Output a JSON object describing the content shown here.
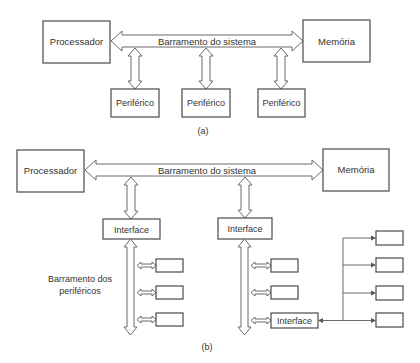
{
  "diagram_a": {
    "processor_label": "Processador",
    "memory_label": "Memória",
    "bus_label": "Barramento do sistema",
    "peripherals": [
      "Periférico",
      "Periférico",
      "Periférico"
    ],
    "caption": "(a)"
  },
  "diagram_b": {
    "processor_label": "Processador",
    "memory_label": "Memória",
    "bus_label": "Barramento do sistema",
    "interfaces": [
      "Interface",
      "Interface",
      "Interface"
    ],
    "peripheral_bus_label_line1": "Barramento dos",
    "peripheral_bus_label_line2": "periféricos",
    "caption": "(b)"
  },
  "colors": {
    "stroke": "#4a4a4a",
    "text": "#333333",
    "background": "#ffffff"
  }
}
